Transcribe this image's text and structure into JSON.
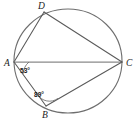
{
  "figure": {
    "type": "circle-geometry-diagram",
    "background_color": "#ffffff",
    "stroke_color": "#5a5a5a",
    "circle_color": "#6e6e6e",
    "label_color": "#1a1a1a"
  },
  "circle": {
    "center_x": 68,
    "center_y": 61,
    "radius_x": 54,
    "radius_y": 52
  },
  "vertices": [
    {
      "id": "A",
      "label": "A",
      "x": 14,
      "y": 62,
      "label_x": 4,
      "label_y": 66
    },
    {
      "id": "B",
      "label": "B",
      "x": 46,
      "y": 106,
      "label_x": 42,
      "label_y": 118
    },
    {
      "id": "C",
      "label": "C",
      "x": 122,
      "y": 62,
      "label_x": 126,
      "label_y": 66
    },
    {
      "id": "D",
      "label": "D",
      "x": 44,
      "y": 12,
      "label_x": 38,
      "label_y": 8
    }
  ],
  "chords": [
    {
      "name": "chord-AD",
      "from": "A",
      "to": "D"
    },
    {
      "name": "chord-AC",
      "from": "A",
      "to": "C"
    },
    {
      "name": "chord-AB",
      "from": "A",
      "to": "B"
    },
    {
      "name": "chord-DC",
      "from": "D",
      "to": "C"
    },
    {
      "name": "chord-BC",
      "from": "B",
      "to": "C"
    }
  ],
  "angles": [
    {
      "id": "angle-A",
      "vertex": "A",
      "value": "53°",
      "label_x": 20,
      "label_y": 73,
      "between": [
        "AB",
        "AC"
      ]
    },
    {
      "id": "angle-B",
      "vertex": "B",
      "value": "89°",
      "label_x": 34,
      "label_y": 97,
      "between": [
        "BA",
        "BC"
      ]
    }
  ]
}
